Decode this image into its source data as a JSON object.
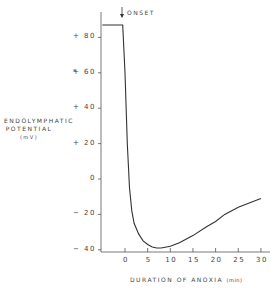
{
  "chart_data": {
    "type": "line",
    "title": "",
    "xlabel": "DURATION OF ANOXIA",
    "xlabel_unit": "(min)",
    "ylabel": "ENDOLYMPHATIC POTENTIAL",
    "ylabel_unit": "(mV)",
    "annotation": "ONSET",
    "annotation_x": 0,
    "xlim": [
      -5,
      31
    ],
    "ylim": [
      -42,
      95
    ],
    "x_ticks": [
      0,
      5,
      10,
      15,
      20,
      25,
      30
    ],
    "x_tick_labels": [
      "0",
      "5",
      "10",
      "15",
      "20",
      "25",
      "30"
    ],
    "y_ticks": [
      80,
      60,
      40,
      20,
      0,
      -20,
      -40
    ],
    "y_tick_labels": [
      "+80",
      "+60",
      "+40",
      "+20",
      "0",
      "-20",
      "-40"
    ],
    "grid": false,
    "legend": null,
    "series": [
      {
        "name": "Endolymphatic potential",
        "x": [
          -5,
          -0.5,
          0,
          0.5,
          1,
          1.5,
          2,
          3,
          4,
          5,
          6,
          7,
          8,
          10,
          12,
          15,
          18,
          20,
          22,
          25,
          28,
          30
        ],
        "y": [
          87,
          87,
          60,
          20,
          -5,
          -18,
          -25,
          -31,
          -35,
          -37,
          -38.5,
          -39,
          -39,
          -38,
          -36,
          -32,
          -27,
          -24,
          -20,
          -16,
          -13,
          -11
        ]
      }
    ]
  },
  "labels": {
    "ylabel_line1": "ENDOLYMPHATIC",
    "ylabel_line2": "POTENTIAL",
    "ylabel_line3": "(mV)",
    "xlabel": "DURATION OF ANOXIA",
    "xlabel_unit": "(min)",
    "onset": "ONSET",
    "asterisk": "*"
  }
}
